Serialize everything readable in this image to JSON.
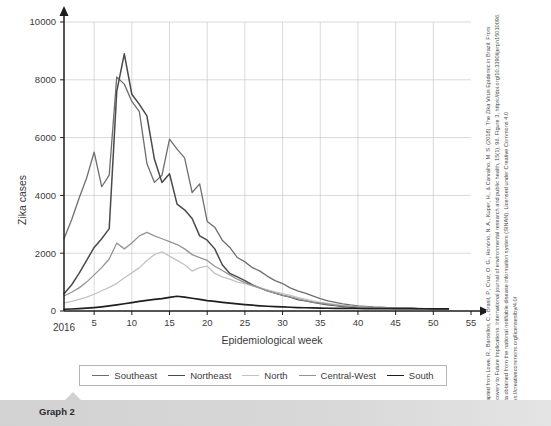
{
  "caption": {
    "label": "Graph 2"
  },
  "citation": {
    "text": "Adapted from Lowe, R., Barcellos, C., Brasil, P., Cruz, O. G., Honório, N. A., Kuper, H., & Carvalho, M. S. (2018). The Zika Virus Epidemic in Brazil: From Discovery to Future Implications. International journal of environmental research and public health, 15(1), 96. Figure 3, https://doi.org/10.3390/ijerph15010096. Data obtained from the national notifiable disease information system (SINAN). Licensed under Creative Commons 4.0 https://creativecommons.org/licenses/by/4.0/"
  },
  "chart_data": {
    "type": "line",
    "title": "",
    "xlabel": "Epidemiological week",
    "ylabel": "Zika cases",
    "origin_label": "2016",
    "xlim": [
      1,
      55
    ],
    "ylim": [
      0,
      10000
    ],
    "xticks": [
      5,
      10,
      15,
      20,
      25,
      30,
      35,
      40,
      45,
      50,
      55
    ],
    "yticks": [
      0,
      2000,
      4000,
      6000,
      8000,
      10000
    ],
    "xtick_labels": [
      "5",
      "10",
      "15",
      "20",
      "25",
      "30",
      "35",
      "40",
      "45",
      "50",
      "55"
    ],
    "ytick_labels": [
      "0",
      "2000",
      "4000",
      "6000",
      "8000",
      "10000"
    ],
    "grid": true,
    "legend_position": "bottom",
    "x": [
      1,
      2,
      3,
      4,
      5,
      6,
      7,
      8,
      9,
      10,
      11,
      12,
      13,
      14,
      15,
      16,
      17,
      18,
      19,
      20,
      21,
      22,
      23,
      24,
      25,
      26,
      27,
      28,
      29,
      30,
      31,
      32,
      33,
      34,
      35,
      36,
      37,
      38,
      39,
      40,
      41,
      42,
      43,
      44,
      45,
      46,
      47,
      48,
      49,
      50,
      51,
      52
    ],
    "series": [
      {
        "name": "Southeast",
        "color": "#6e6e6e",
        "width": 1.3,
        "values": [
          2500,
          3150,
          3900,
          4600,
          5500,
          4300,
          4700,
          8100,
          7850,
          7250,
          6900,
          5100,
          4450,
          4700,
          5950,
          5600,
          5300,
          4100,
          4400,
          3100,
          2900,
          2450,
          2200,
          1850,
          1700,
          1500,
          1380,
          1200,
          1050,
          950,
          800,
          700,
          620,
          520,
          430,
          350,
          300,
          250,
          210,
          180,
          160,
          140,
          130,
          120,
          110,
          100,
          95,
          90,
          85,
          80,
          78,
          75
        ]
      },
      {
        "name": "Northeast",
        "color": "#4a4a4a",
        "width": 1.5,
        "values": [
          600,
          900,
          1300,
          1750,
          2200,
          2500,
          2850,
          7600,
          8900,
          7500,
          7150,
          6750,
          5250,
          4450,
          4750,
          3700,
          3500,
          3200,
          2600,
          2450,
          2150,
          1600,
          1300,
          1180,
          1050,
          900,
          800,
          700,
          620,
          540,
          480,
          400,
          350,
          300,
          260,
          220,
          190,
          160,
          140,
          125,
          115,
          105,
          100,
          95,
          90,
          88,
          85,
          82,
          80,
          78,
          76,
          75
        ]
      },
      {
        "name": "North",
        "color": "#c3c3c3",
        "width": 1.3,
        "values": [
          280,
          330,
          400,
          480,
          580,
          700,
          820,
          950,
          1150,
          1320,
          1500,
          1750,
          1950,
          2050,
          1900,
          1750,
          1600,
          1380,
          1500,
          1550,
          1300,
          1180,
          1100,
          1000,
          950,
          880,
          800,
          730,
          660,
          600,
          540,
          470,
          410,
          350,
          300,
          260,
          225,
          195,
          170,
          150,
          135,
          120,
          110,
          102,
          95,
          90,
          86,
          82,
          80,
          78,
          76,
          75
        ]
      },
      {
        "name": "Central-West",
        "color": "#949494",
        "width": 1.3,
        "values": [
          520,
          650,
          800,
          1000,
          1250,
          1500,
          1800,
          2350,
          2150,
          2350,
          2600,
          2720,
          2600,
          2500,
          2400,
          2300,
          2150,
          1950,
          1850,
          1750,
          1550,
          1400,
          1250,
          1100,
          980,
          880,
          790,
          700,
          620,
          550,
          490,
          420,
          360,
          310,
          270,
          235,
          205,
          180,
          160,
          145,
          132,
          120,
          112,
          105,
          98,
          93,
          89,
          85,
          82,
          80,
          78,
          76
        ]
      },
      {
        "name": "South",
        "color": "#1f1f1f",
        "width": 1.7,
        "values": [
          60,
          70,
          85,
          100,
          120,
          145,
          175,
          210,
          250,
          290,
          330,
          370,
          400,
          430,
          470,
          510,
          480,
          440,
          400,
          360,
          330,
          300,
          270,
          245,
          220,
          200,
          180,
          165,
          150,
          140,
          130,
          120,
          112,
          105,
          100,
          95,
          92,
          90,
          88,
          86,
          85,
          84,
          83,
          82,
          81,
          80,
          79,
          78,
          77,
          76,
          75,
          74
        ]
      }
    ]
  }
}
